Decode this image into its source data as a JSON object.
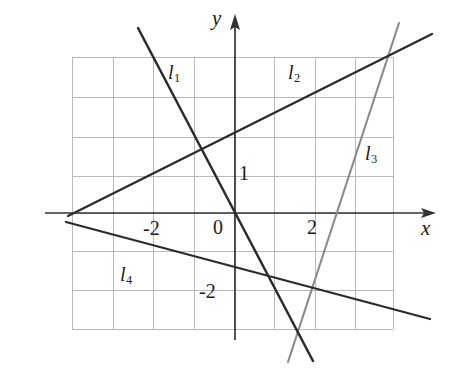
{
  "figure": {
    "kind": "coordinate-plane-line-graph",
    "width": 457,
    "height": 382,
    "background": "#ffffff",
    "ink_color": "#2b2b2b",
    "grid_color": "#b9b9b9",
    "axis_color": "#333333",
    "line3_color": "#8a8a8a"
  },
  "axes": {
    "x_label": "x",
    "y_label": "y",
    "origin_label": "0",
    "origin_px": {
      "x": 235,
      "y": 213
    },
    "unit_px": 40,
    "x_ticks": [
      {
        "label": "-2",
        "value": -2,
        "px_x": 155,
        "px_y": 228
      },
      {
        "label": "2",
        "value": 2,
        "px_x": 313,
        "px_y": 227
      }
    ],
    "y_ticks": [
      {
        "label": "1",
        "value": 1,
        "px_x": 243,
        "px_y": 172
      },
      {
        "label": "-2",
        "value": -2,
        "px_x": 212,
        "px_y": 291
      }
    ]
  },
  "grid": {
    "left": 72,
    "right": 393,
    "top": 57,
    "bottom": 329,
    "spacing": 40,
    "vertical_x": [
      72,
      113,
      153,
      194,
      234,
      274,
      315,
      355,
      393
    ],
    "horizontal_y": [
      57,
      97,
      137,
      176,
      213,
      251,
      290,
      329
    ]
  },
  "chart_data": {
    "type": "line",
    "title": "",
    "xlabel": "x",
    "ylabel": "y",
    "grid": true,
    "legend": "inline-labels",
    "xlim": [
      -4.1,
      4.0
    ],
    "ylim": [
      -3.9,
      3.9
    ],
    "series": [
      {
        "name": "l1",
        "label": "l",
        "sub": "1",
        "color": "#2b2b2b",
        "label_px": {
          "x": 168,
          "y": 62
        },
        "pixel_endpoints": [
          {
            "x": 138,
            "y": 28
          },
          {
            "x": 313,
            "y": 361
          }
        ],
        "points": [
          {
            "x": -2.43,
            "y": 4.63
          },
          {
            "x": 1.95,
            "y": -3.7
          }
        ],
        "slope": -1.9,
        "intercept": 0.0
      },
      {
        "name": "l2",
        "label": "l",
        "sub": "2",
        "color": "#2b2b2b",
        "label_px": {
          "x": 288,
          "y": 62
        },
        "pixel_endpoints": [
          {
            "x": 68,
            "y": 216
          },
          {
            "x": 432,
            "y": 34
          }
        ],
        "points": [
          {
            "x": -4.18,
            "y": -0.08
          },
          {
            "x": 4.93,
            "y": 4.48
          }
        ],
        "slope": 0.5,
        "intercept": 2.0
      },
      {
        "name": "l3",
        "label": "l",
        "sub": "3",
        "color": "#8a8a8a",
        "label_px": {
          "x": 365,
          "y": 143
        },
        "pixel_endpoints": [
          {
            "x": 288,
            "y": 362
          },
          {
            "x": 399,
            "y": 23
          }
        ],
        "points": [
          {
            "x": 1.33,
            "y": -3.73
          },
          {
            "x": 4.1,
            "y": 4.75
          }
        ],
        "slope": 3.06,
        "intercept": -7.8
      },
      {
        "name": "l4",
        "label": "l",
        "sub": "4",
        "color": "#2b2b2b",
        "label_px": {
          "x": 120,
          "y": 264
        },
        "pixel_endpoints": [
          {
            "x": 66,
            "y": 222
          },
          {
            "x": 430,
            "y": 319
          }
        ],
        "points": [
          {
            "x": -4.23,
            "y": -0.23
          },
          {
            "x": 4.88,
            "y": -2.65
          }
        ],
        "slope": -0.27,
        "intercept": -1.3
      }
    ]
  },
  "labels": {
    "l1": {
      "base": "l",
      "sub": "1"
    },
    "l2": {
      "base": "l",
      "sub": "2"
    },
    "l3": {
      "base": "l",
      "sub": "3"
    },
    "l4": {
      "base": "l",
      "sub": "4"
    },
    "y_axis": "y",
    "x_axis": "x",
    "origin": "0",
    "x_neg2": "-2",
    "x_pos2": "2",
    "y_pos1": "1",
    "y_neg2": "-2"
  }
}
